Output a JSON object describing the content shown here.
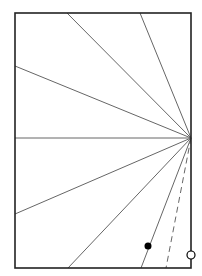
{
  "diagram": {
    "frame": {
      "x": 15,
      "y": 13,
      "width": 176,
      "height": 255,
      "stroke": "#222222",
      "stroke_width": 1.6
    },
    "focal_point": {
      "x": 191,
      "y": 138
    },
    "rays": [
      {
        "id": "ray-top-1",
        "x2": 67,
        "y2": 13,
        "style": "solid"
      },
      {
        "id": "ray-top-2",
        "x2": 140,
        "y2": 13,
        "style": "solid"
      },
      {
        "id": "ray-left-upper",
        "x2": 15,
        "y2": 66,
        "style": "solid"
      },
      {
        "id": "ray-horizontal",
        "x2": 15,
        "y2": 138,
        "style": "solid"
      },
      {
        "id": "ray-left-lower",
        "x2": 15,
        "y2": 214,
        "style": "solid"
      },
      {
        "id": "ray-bottom-1",
        "x2": 68,
        "y2": 268,
        "style": "solid"
      },
      {
        "id": "ray-bottom-2",
        "x2": 141,
        "y2": 268,
        "style": "solid"
      },
      {
        "id": "ray-dashed",
        "x2": 166,
        "y2": 268,
        "style": "dashed"
      }
    ],
    "ray_color": "#666666",
    "filled_dot": {
      "cx": 148,
      "cy": 246,
      "r": 3.5,
      "fill": "#000000"
    },
    "open_circle": {
      "cx": 191,
      "cy": 255,
      "r": 4,
      "stroke": "#000000",
      "fill": "#ffffff"
    }
  }
}
